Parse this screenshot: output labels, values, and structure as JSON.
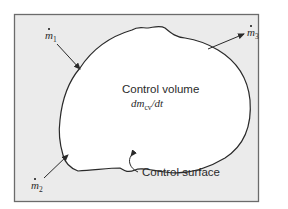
{
  "diagram": {
    "colors": {
      "frame_fill": "#ebebeb",
      "frame_stroke": "#6b6b6b",
      "volume_fill": "#ffffff",
      "line": "#2a2a2a",
      "text": "#2a2a2a"
    },
    "control_volume": {
      "label": "Control volume",
      "rate_main": "dm",
      "rate_sub": "cv",
      "rate_tail": "/dt"
    },
    "control_surface": {
      "label": "Control surface"
    },
    "flows": [
      {
        "id": "m1",
        "symbol": "m",
        "subscript": "1",
        "direction": "inflow"
      },
      {
        "id": "m2",
        "symbol": "m",
        "subscript": "2",
        "direction": "inflow"
      },
      {
        "id": "m3",
        "symbol": "m",
        "subscript": "3",
        "direction": "outflow"
      }
    ]
  }
}
